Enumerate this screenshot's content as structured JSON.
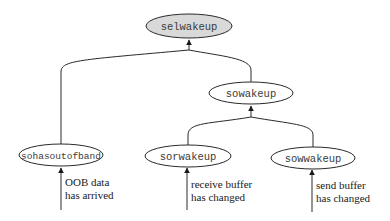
{
  "diagram": {
    "nodes": {
      "selwakeup": {
        "label": "selwakeup",
        "fill": "#d9d9d9",
        "highlighted": true
      },
      "sowakeup": {
        "label": "sowakeup",
        "fill": "#ffffff"
      },
      "sohasoutofband": {
        "label": "sohasoutofband",
        "fill": "#ffffff"
      },
      "sorwakeup": {
        "label": "sorwakeup",
        "fill": "#ffffff"
      },
      "sowwakeup": {
        "label": "sowwakeup",
        "fill": "#ffffff"
      }
    },
    "edges": [
      {
        "from": "sohasoutofband",
        "to": "selwakeup"
      },
      {
        "from": "sowakeup",
        "to": "selwakeup"
      },
      {
        "from": "sorwakeup",
        "to": "sowakeup"
      },
      {
        "from": "sowwakeup",
        "to": "sowakeup"
      }
    ],
    "triggers": {
      "oob": {
        "line1": "OOB data",
        "line2": "has arrived",
        "target": "sohasoutofband"
      },
      "receive": {
        "line1": "receive buffer",
        "line2": "has changed",
        "target": "sorwakeup"
      },
      "send": {
        "line1": "send buffer",
        "line2": "has changed",
        "target": "sowwakeup"
      }
    }
  }
}
